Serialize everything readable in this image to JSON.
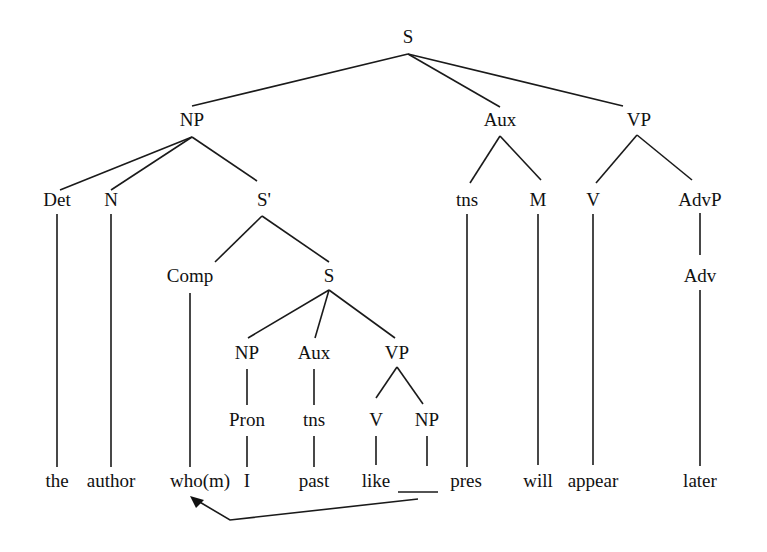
{
  "diagram": {
    "type": "syntax-tree",
    "sentence": "the author who(m) I past like___ pres will appear later",
    "nodes": [
      {
        "id": "S_root",
        "label": "S",
        "x": 408,
        "y": 39
      },
      {
        "id": "NP_main",
        "label": "NP",
        "x": 192,
        "y": 122
      },
      {
        "id": "Aux_main",
        "label": "Aux",
        "x": 500,
        "y": 122
      },
      {
        "id": "VP_main",
        "label": "VP",
        "x": 639,
        "y": 122
      },
      {
        "id": "Det",
        "label": "Det",
        "x": 57,
        "y": 202
      },
      {
        "id": "N",
        "label": "N",
        "x": 111,
        "y": 202
      },
      {
        "id": "S_bar",
        "label": "S'",
        "x": 264,
        "y": 202
      },
      {
        "id": "tns_main",
        "label": "tns",
        "x": 467,
        "y": 202
      },
      {
        "id": "M",
        "label": "M",
        "x": 538,
        "y": 202
      },
      {
        "id": "V_main",
        "label": "V",
        "x": 593,
        "y": 202
      },
      {
        "id": "AdvP",
        "label": "AdvP",
        "x": 700,
        "y": 202
      },
      {
        "id": "Comp",
        "label": "Comp",
        "x": 190,
        "y": 278
      },
      {
        "id": "S_emb",
        "label": "S",
        "x": 329,
        "y": 278
      },
      {
        "id": "Adv",
        "label": "Adv",
        "x": 700,
        "y": 278
      },
      {
        "id": "NP_emb",
        "label": "NP",
        "x": 247,
        "y": 355
      },
      {
        "id": "Aux_emb",
        "label": "Aux",
        "x": 314,
        "y": 355
      },
      {
        "id": "VP_emb",
        "label": "VP",
        "x": 397,
        "y": 355
      },
      {
        "id": "Pron",
        "label": "Pron",
        "x": 247,
        "y": 422
      },
      {
        "id": "tns_emb",
        "label": "tns",
        "x": 314,
        "y": 422
      },
      {
        "id": "V_emb",
        "label": "V",
        "x": 376,
        "y": 422
      },
      {
        "id": "NP_gap",
        "label": "NP",
        "x": 427,
        "y": 422
      }
    ],
    "leaves": [
      {
        "id": "leaf_the",
        "label": "the",
        "x": 57,
        "y": 483
      },
      {
        "id": "leaf_author",
        "label": "author",
        "x": 111,
        "y": 483
      },
      {
        "id": "leaf_whom",
        "label": "who(m)",
        "x": 200,
        "y": 483
      },
      {
        "id": "leaf_I",
        "label": "I",
        "x": 247,
        "y": 483
      },
      {
        "id": "leaf_past",
        "label": "past",
        "x": 314,
        "y": 483
      },
      {
        "id": "leaf_like",
        "label": "like",
        "x": 376,
        "y": 483
      },
      {
        "id": "leaf_pres",
        "label": "pres",
        "x": 466,
        "y": 483
      },
      {
        "id": "leaf_will",
        "label": "will",
        "x": 538,
        "y": 483
      },
      {
        "id": "leaf_appear",
        "label": "appear",
        "x": 593,
        "y": 483
      },
      {
        "id": "leaf_later",
        "label": "later",
        "x": 700,
        "y": 483
      }
    ],
    "gap": {
      "label": "____",
      "x1": 398,
      "y1": 492,
      "x2": 438,
      "y2": 492
    },
    "edges": [
      [
        408,
        54,
        192,
        106
      ],
      [
        408,
        54,
        500,
        107
      ],
      [
        408,
        54,
        623,
        106
      ],
      [
        192,
        137,
        60,
        190
      ],
      [
        192,
        137,
        111,
        190
      ],
      [
        192,
        137,
        257,
        181
      ],
      [
        500,
        136,
        470,
        183
      ],
      [
        500,
        136,
        541,
        180
      ],
      [
        637,
        135,
        596,
        183
      ],
      [
        637,
        135,
        692,
        180
      ],
      [
        57,
        214,
        57,
        467
      ],
      [
        111,
        214,
        111,
        467
      ],
      [
        262,
        216,
        215,
        262
      ],
      [
        262,
        216,
        329,
        262
      ],
      [
        467,
        214,
        467,
        467
      ],
      [
        538,
        214,
        538,
        465
      ],
      [
        593,
        214,
        593,
        465
      ],
      [
        700,
        213,
        700,
        255
      ],
      [
        700,
        290,
        700,
        466
      ],
      [
        190,
        293,
        190,
        467
      ],
      [
        329,
        290,
        248,
        338
      ],
      [
        329,
        290,
        315,
        338
      ],
      [
        329,
        290,
        395,
        338
      ],
      [
        247,
        369,
        247,
        405
      ],
      [
        314,
        369,
        314,
        405
      ],
      [
        397,
        367,
        376,
        398
      ],
      [
        397,
        367,
        423,
        404
      ],
      [
        247,
        436,
        247,
        467
      ],
      [
        314,
        436,
        314,
        467
      ],
      [
        376,
        436,
        376,
        465
      ],
      [
        427,
        436,
        427,
        466
      ]
    ],
    "movement_arrow": {
      "description": "trace arrow from gap NP back to who(m)",
      "points": [
        [
          418,
          499
        ],
        [
          230,
          520
        ],
        [
          198,
          501
        ]
      ],
      "arrowhead": [
        [
          190,
          496
        ],
        [
          204,
          500
        ],
        [
          196,
          508
        ]
      ]
    }
  }
}
